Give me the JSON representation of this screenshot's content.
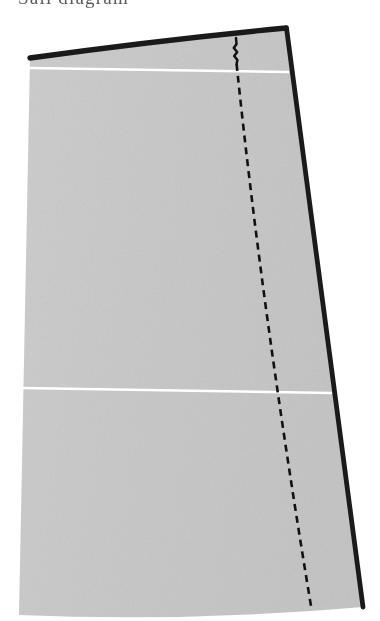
{
  "page": {
    "background_color": "#ffffff",
    "width": 380,
    "height": 621
  },
  "caption": {
    "text": "Sail diagram",
    "note": "top of line cropped by image edge"
  },
  "figure": {
    "name": "panel-piece",
    "colors": {
      "panel_fill": "#c7c7c7",
      "panel_fill_light": "#cfcfcf",
      "heavy_edge": "#1a1a1a",
      "seam_line": "#ffffff",
      "dashed_line": "#111111",
      "paper": "#ffffff"
    },
    "geometry": {
      "top_left": [
        30,
        58
      ],
      "top_right": [
        286,
        28
      ],
      "bottom_right": [
        363,
        607
      ],
      "bottom_left": [
        19,
        615
      ],
      "top_edge_type": "curve",
      "top_edge_control": [
        160,
        52
      ],
      "bottom_edge_type": "curve",
      "bottom_edge_control": [
        190,
        622
      ]
    },
    "edges": [
      {
        "name": "top-edge",
        "style": "heavy-solid",
        "weight": 5.5,
        "color": "#1a1a1a"
      },
      {
        "name": "right-edge",
        "style": "heavy-solid",
        "weight": 5.0,
        "color": "#1a1a1a"
      },
      {
        "name": "bottom-edge",
        "style": "none",
        "weight": 0,
        "color": "#c7c7c7"
      },
      {
        "name": "left-edge",
        "style": "none",
        "weight": 0,
        "color": "#c7c7c7"
      }
    ],
    "seam_lines": [
      {
        "name": "upper-seam-line",
        "from": [
          29,
          68
        ],
        "to": [
          288,
          72
        ],
        "color": "#ffffff",
        "weight": 2.2
      },
      {
        "name": "lower-seam-line",
        "from": [
          23,
          388
        ],
        "to": [
          330,
          392
        ],
        "color": "#ffffff",
        "weight": 2.2
      }
    ],
    "grain_line": {
      "name": "grain-line",
      "style": "dashed",
      "color": "#111111",
      "weight": 2.6,
      "dash": "7 5",
      "from": [
        236,
        38
      ],
      "to": [
        311,
        606
      ],
      "control": [
        262,
        310
      ],
      "squiggle": {
        "present": true,
        "from_y": 44,
        "to_y": 62,
        "amplitude": 2.5
      }
    }
  }
}
